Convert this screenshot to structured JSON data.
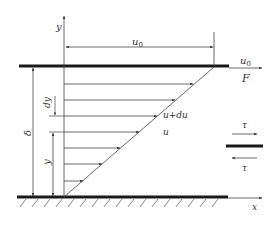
{
  "diagram": {
    "colors": {
      "line": "#444444",
      "plate": "#1a1a1a",
      "text": "#333333"
    },
    "labels": {
      "y_axis": "y",
      "x_axis": "x",
      "plate_velocity_top": "u",
      "plate_velocity_top_sub": "0",
      "plate_velocity_right": "u",
      "plate_velocity_right_sub": "0",
      "force": "F",
      "gap": "δ",
      "dy": "dy",
      "y_dim": "y",
      "u_plus_du": "u+du",
      "u": "u",
      "tau_top": "τ",
      "tau_bottom": "τ"
    },
    "velocity_arrows_count": 7
  }
}
